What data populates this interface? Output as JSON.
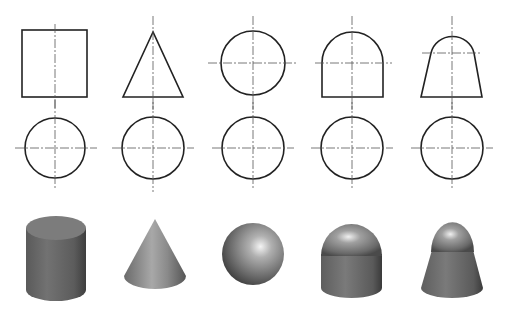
{
  "figure": {
    "background": "#ffffff",
    "line_color": "#222222",
    "centerline_color": "#555555",
    "columns": [
      {
        "id": "cylinder",
        "front_view": "rectangle",
        "top_view": "circle",
        "solid": "cylinder",
        "cx": 55
      },
      {
        "id": "cone",
        "front_view": "triangle",
        "top_view": "circle",
        "solid": "cone",
        "cx": 153
      },
      {
        "id": "sphere",
        "front_view": "circle",
        "top_view": "circle",
        "solid": "sphere",
        "cx": 253
      },
      {
        "id": "domed-cylinder",
        "front_view": "rectangle with semicircular top",
        "top_view": "circle",
        "solid": "cylinder capped with hemisphere",
        "cx": 352
      },
      {
        "id": "domed-frustum",
        "front_view": "trapezoid with arc top",
        "top_view": "circle",
        "solid": "frustum capped with dome",
        "cx": 452
      }
    ],
    "rows": [
      "front-views",
      "top-views",
      "3d-solids"
    ]
  }
}
